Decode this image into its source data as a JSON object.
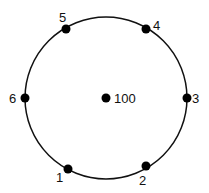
{
  "diagram": {
    "type": "circle-with-points",
    "colors": {
      "stroke": "#111111",
      "point": "#000000",
      "background": "#ffffff"
    },
    "circle": {
      "cx": 106,
      "cy": 98,
      "r": 81
    },
    "center": {
      "x": 106,
      "y": 98,
      "label": "100",
      "label_x": 114,
      "label_y": 103
    },
    "points": [
      {
        "id": "1",
        "label": "1",
        "x": 68,
        "y": 169,
        "label_x": 56,
        "label_y": 182
      },
      {
        "id": "2",
        "label": "2",
        "x": 146,
        "y": 166,
        "label_x": 139,
        "label_y": 185
      },
      {
        "id": "3",
        "label": "3",
        "x": 187,
        "y": 98,
        "label_x": 192,
        "label_y": 103
      },
      {
        "id": "4",
        "label": "4",
        "x": 146,
        "y": 29,
        "label_x": 153,
        "label_y": 30
      },
      {
        "id": "5",
        "label": "5",
        "x": 66,
        "y": 29,
        "label_x": 59,
        "label_y": 22
      },
      {
        "id": "6",
        "label": "6",
        "x": 25,
        "y": 98,
        "label_x": 9,
        "label_y": 103
      }
    ]
  }
}
